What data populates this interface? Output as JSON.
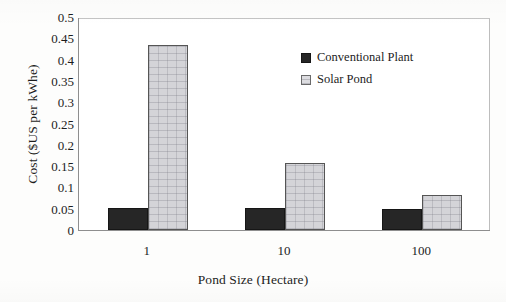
{
  "chart_data": {
    "type": "bar",
    "title": "",
    "categories": [
      "1",
      "10",
      "100"
    ],
    "series": [
      {
        "name": "Conventional Plant",
        "values": [
          0.052,
          0.052,
          0.05
        ],
        "color": "#262626"
      },
      {
        "name": "Solar Pond",
        "values": [
          0.435,
          0.157,
          0.082
        ],
        "color": "#d4d4d8"
      }
    ],
    "xlabel": "Pond Size (Hectare)",
    "ylabel": "Cost ($US per kWhe)",
    "ylim": [
      0,
      0.5
    ],
    "ytick_labels": [
      "0",
      "0.05",
      "0.1",
      "0.15",
      "0.2",
      "0.25",
      "0.3",
      "0.35",
      "0.4",
      "0.45",
      "0.5"
    ],
    "ytick_values": [
      0,
      0.05,
      0.1,
      0.15,
      0.2,
      0.25,
      0.3,
      0.35,
      0.4,
      0.45,
      0.5
    ],
    "grid": false,
    "legend_position": "upper-center-right"
  },
  "axes": {
    "y_title": "Cost ($US per kWhe)",
    "x_title": "Pond Size (Hectare)"
  },
  "legend": {
    "items": [
      {
        "label": "Conventional Plant",
        "swatch": "dark-filled-square"
      },
      {
        "label": "Solar Pond",
        "swatch": "light-hatched-square"
      }
    ]
  }
}
